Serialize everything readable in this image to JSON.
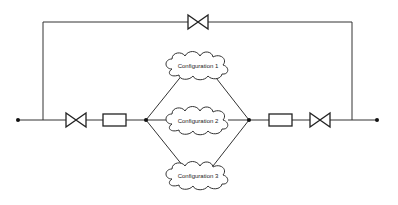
{
  "diagram": {
    "type": "process-flow-schematic",
    "nodes": {
      "left_terminal": {
        "shape": "dot"
      },
      "right_terminal": {
        "shape": "dot"
      },
      "left_junction": {
        "shape": "dot"
      },
      "right_junction": {
        "shape": "dot"
      }
    },
    "components": [
      {
        "id": "bypass_valve",
        "shape": "valve",
        "location": "top bypass line"
      },
      {
        "id": "left_valve",
        "shape": "valve",
        "location": "main line left"
      },
      {
        "id": "left_block",
        "shape": "rectangle",
        "location": "main line left"
      },
      {
        "id": "right_block",
        "shape": "rectangle",
        "location": "main line right"
      },
      {
        "id": "right_valve",
        "shape": "valve",
        "location": "main line right"
      }
    ],
    "configurations": [
      {
        "label": "Configuration 1"
      },
      {
        "label": "Configuration 2"
      },
      {
        "label": "Configuration 3"
      }
    ],
    "colors": {
      "line": "#333333",
      "background": "#ffffff"
    }
  }
}
